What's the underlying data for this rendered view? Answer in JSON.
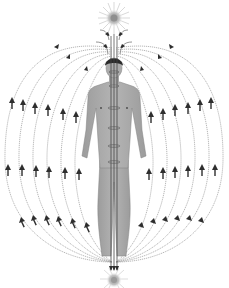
{
  "diagram": {
    "colors": {
      "background": "#ffffff",
      "field_line": "#9a9a9a",
      "arrow": "#2e2e2e",
      "body": "#a8a8a8",
      "body_outline": "#7a7a7a",
      "hair": "#2a2a2a",
      "central_channel": "#444444",
      "burst": "#b0b0b0"
    },
    "top_burst": {
      "cx": 114,
      "cy": 18,
      "r": 12
    },
    "bottom_burst": {
      "cx": 114,
      "cy": 279,
      "r": 10
    },
    "field_lines_per_side": 6,
    "arrow_direction": "up"
  }
}
